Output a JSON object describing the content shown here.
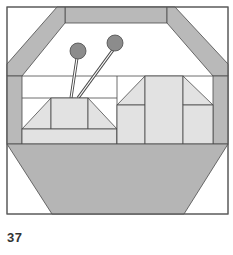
{
  "figure": {
    "label": "37",
    "colors": {
      "background": "#ffffff",
      "outline": "#4a4a4a",
      "frame": "#b9b9b9",
      "light_fill": "#e2e2e2",
      "basket": "#b5b5b5",
      "yarn_ball": "#8c8c8c"
    },
    "pieces": {
      "frame": [
        "top-bar",
        "left-diagonal-band",
        "right-diagonal-band",
        "left-side-bar",
        "right-side-bar"
      ],
      "left_block": [
        "trapezoid-left-triangle",
        "trapezoid-center-square",
        "trapezoid-right-triangle",
        "base-strip"
      ],
      "right_block": [
        "left-triangle",
        "left-lower-square",
        "center-column",
        "right-triangle",
        "right-lower-square"
      ],
      "needles": [
        "left-needle",
        "right-needle"
      ],
      "basket": [
        "basket-trapezoid"
      ]
    }
  }
}
